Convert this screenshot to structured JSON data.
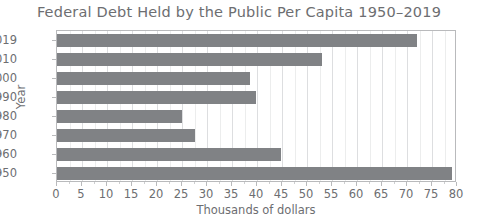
{
  "chart_data": {
    "type": "bar",
    "orientation": "horizontal",
    "title": "Federal Debt Held by the Public Per Capita 1950–2019",
    "xlabel": "Thousands of dollars",
    "ylabel": "Year",
    "categories": [
      "2019",
      "2010",
      "2000",
      "1990",
      "1980",
      "1970",
      "1960",
      "1950"
    ],
    "values": [
      72,
      53,
      38.5,
      39.7,
      25,
      27.5,
      44.7,
      79
    ],
    "xlim": [
      0,
      80
    ],
    "xticks": [
      0,
      5,
      10,
      15,
      20,
      25,
      30,
      35,
      40,
      45,
      50,
      55,
      60,
      65,
      70,
      75,
      80
    ],
    "xtick_labels": [
      "0",
      "5",
      "10",
      "15",
      "20",
      "25",
      "30",
      "35",
      "40",
      "45",
      "50",
      "55",
      "60",
      "65",
      "70",
      "75",
      "80"
    ],
    "grid": true,
    "legend": false,
    "bar_color": "#808285",
    "text_color": "#6d6e71",
    "frame_color": "#b9babc",
    "gridline_color": "#dddee0",
    "background": "#ffffff"
  }
}
